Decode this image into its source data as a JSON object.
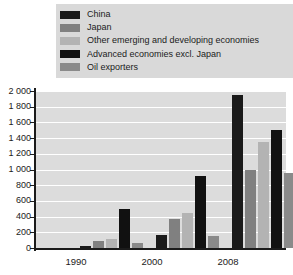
{
  "legend": {
    "position": "top",
    "items": [
      {
        "label": "China",
        "color": "#1a1a1a"
      },
      {
        "label": "Japan",
        "color": "#808080"
      },
      {
        "label": "Other emerging and developing economies",
        "color": "#b3b3b3"
      },
      {
        "label": "Advanced economies excl. Japan",
        "color": "#111111"
      },
      {
        "label": "Oil exporters",
        "color": "#8a8a8a"
      }
    ]
  },
  "axis": {
    "y_ticks": [
      "2 000",
      "1 800",
      "1 600",
      "1 400",
      "1 200",
      "1 000",
      "800",
      "600",
      "400",
      "200",
      "0"
    ],
    "x_ticks": [
      "1990",
      "2000",
      "2008"
    ]
  },
  "chart_data": {
    "type": "bar",
    "title": "",
    "xlabel": "",
    "ylabel": "",
    "ylim": [
      0,
      2000
    ],
    "ytick_step": 200,
    "grid": true,
    "legend_position": "top",
    "categories": [
      "1990",
      "2000",
      "2008"
    ],
    "series": [
      {
        "name": "China",
        "color": "#1a1a1a",
        "values": [
          20,
          170,
          1950
        ]
      },
      {
        "name": "Japan",
        "color": "#808080",
        "values": [
          90,
          370,
          1000
        ]
      },
      {
        "name": "Other emerging and developing economies",
        "color": "#b3b3b3",
        "values": [
          110,
          450,
          1350
        ]
      },
      {
        "name": "Advanced economies excl. Japan",
        "color": "#111111",
        "values": [
          500,
          920,
          1500
        ]
      },
      {
        "name": "Oil exporters",
        "color": "#8a8a8a",
        "values": [
          60,
          150,
          950
        ]
      }
    ]
  }
}
